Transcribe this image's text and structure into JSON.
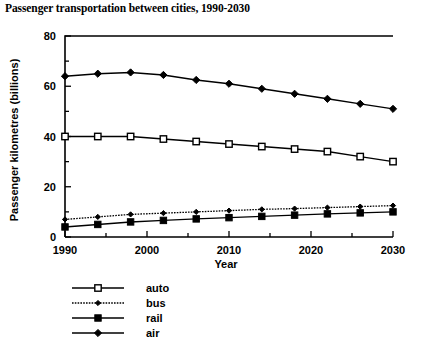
{
  "chart_data": {
    "type": "line",
    "title": "Passenger transportation between cities, 1990-2030",
    "xlabel": "Year",
    "ylabel": "Passenger  kilometres  (billions)",
    "xlim": [
      1990,
      2030
    ],
    "ylim": [
      0,
      80
    ],
    "x_ticks_major": [
      "1990",
      "2000",
      "2010",
      "2020",
      "2030"
    ],
    "x_ticks_major_values": [
      1990,
      2000,
      2010,
      2020,
      2030
    ],
    "x_ticks_minor_values": [
      1995,
      2005,
      2015,
      2025
    ],
    "y_ticks_major": [
      "0",
      "20",
      "40",
      "60",
      "80"
    ],
    "y_ticks_major_values": [
      0,
      20,
      40,
      60,
      80
    ],
    "y_ticks_minor_values": [
      10,
      30,
      50,
      70
    ],
    "grid": false,
    "legend_position": "below-left",
    "x": [
      1990,
      1994,
      1998,
      2002,
      2006,
      2010,
      2014,
      2018,
      2022,
      2026,
      2030
    ],
    "series": [
      {
        "name": "auto",
        "marker": "open-square",
        "line_style": "solid",
        "values": [
          40,
          40,
          40,
          39,
          38,
          37,
          36,
          35,
          34,
          32,
          30
        ]
      },
      {
        "name": "bus",
        "marker": "small-diamond",
        "line_style": "dotted",
        "values": [
          7,
          8,
          9,
          9.5,
          10,
          10.5,
          11,
          11.3,
          11.7,
          12.1,
          12.5
        ]
      },
      {
        "name": "rail",
        "marker": "filled-square",
        "line_style": "solid",
        "values": [
          4,
          5,
          6,
          6.6,
          7.2,
          7.7,
          8.2,
          8.7,
          9.2,
          9.6,
          10
        ]
      },
      {
        "name": "air",
        "marker": "filled-diamond",
        "line_style": "solid",
        "values": [
          64,
          65,
          65.5,
          64.5,
          62.5,
          61,
          59,
          57,
          55,
          53,
          51
        ]
      }
    ]
  },
  "legend": {
    "items": [
      {
        "label": "auto"
      },
      {
        "label": "bus"
      },
      {
        "label": "rail"
      },
      {
        "label": "air"
      }
    ]
  },
  "colors": {
    "foreground": "#000000",
    "background": "#ffffff"
  }
}
